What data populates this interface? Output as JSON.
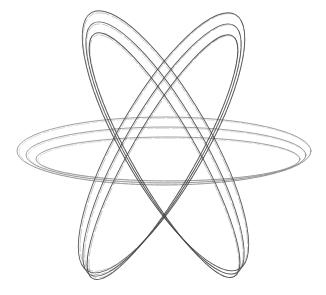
{
  "figure": {
    "background": "#ffffff",
    "stroke_color": "#555555",
    "canvas": {
      "width": 326,
      "height": 295
    },
    "ring_groups": [
      {
        "name": "horizontal-rings",
        "center": [
          164,
          155
        ],
        "rotation": 0,
        "stroke": "#8a8a8a",
        "rings": [
          {
            "rx": 147,
            "ry": 34,
            "dx": 0,
            "dy": -4
          },
          {
            "rx": 140,
            "ry": 28,
            "dx": 2,
            "dy": 0
          },
          {
            "rx": 132,
            "ry": 22,
            "dx": 4,
            "dy": 4
          }
        ]
      },
      {
        "name": "tilted-rings-a",
        "center": [
          165,
          148
        ],
        "rotation": 60,
        "stroke": "#4a4a4a",
        "rings": [
          {
            "rx": 148,
            "ry": 44,
            "dx": -6,
            "dy": -4
          },
          {
            "rx": 144,
            "ry": 38,
            "dx": 0,
            "dy": 0
          },
          {
            "rx": 140,
            "ry": 32,
            "dx": 6,
            "dy": 4
          }
        ]
      },
      {
        "name": "tilted-rings-b",
        "center": [
          162,
          150
        ],
        "rotation": -60,
        "stroke": "#4a4a4a",
        "rings": [
          {
            "rx": 148,
            "ry": 44,
            "dx": 6,
            "dy": -4
          },
          {
            "rx": 144,
            "ry": 38,
            "dx": 0,
            "dy": 0
          },
          {
            "rx": 140,
            "ry": 32,
            "dx": -6,
            "dy": 4
          }
        ]
      }
    ]
  }
}
